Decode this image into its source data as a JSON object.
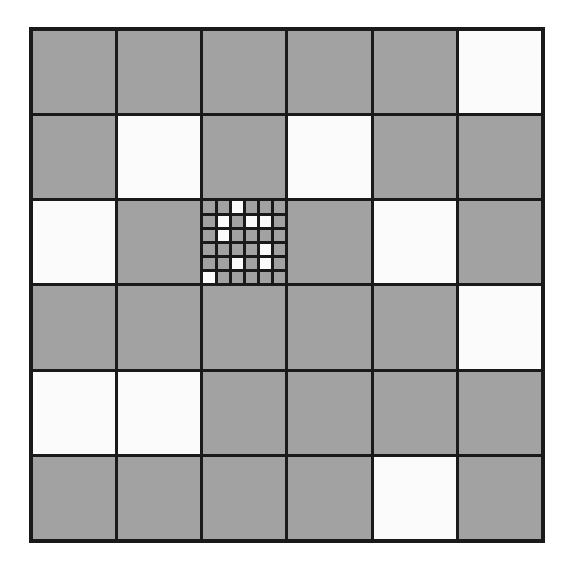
{
  "diagram": {
    "type": "grid",
    "rows": 6,
    "cols": 6,
    "colors": {
      "filled": "#a2a2a2",
      "empty": "#fbfbfb",
      "line": "#1a1a1a"
    },
    "cells": [
      [
        "G",
        "G",
        "G",
        "G",
        "G",
        "W"
      ],
      [
        "G",
        "W",
        "G",
        "W",
        "G",
        "G"
      ],
      [
        "W",
        "G",
        "S",
        "G",
        "W",
        "G"
      ],
      [
        "G",
        "G",
        "G",
        "G",
        "G",
        "W"
      ],
      [
        "W",
        "W",
        "G",
        "G",
        "G",
        "G"
      ],
      [
        "G",
        "G",
        "G",
        "G",
        "W",
        "G"
      ]
    ],
    "legend": {
      "G": "gray cell",
      "W": "white cell",
      "S": "subdivided cell"
    },
    "subgrid": {
      "row": 2,
      "col": 2,
      "rows": 6,
      "cols": 6,
      "cells": [
        [
          "G",
          "G",
          "W",
          "G",
          "G",
          "G"
        ],
        [
          "G",
          "W",
          "G",
          "W",
          "W",
          "G"
        ],
        [
          "G",
          "W",
          "G",
          "G",
          "G",
          "G"
        ],
        [
          "G",
          "G",
          "G",
          "G",
          "W",
          "G"
        ],
        [
          "G",
          "G",
          "W",
          "G",
          "W",
          "G"
        ],
        [
          "W",
          "G",
          "G",
          "G",
          "G",
          "G"
        ]
      ]
    }
  }
}
